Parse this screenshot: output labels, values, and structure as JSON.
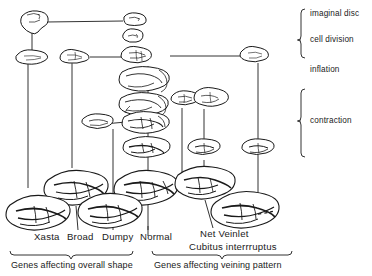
{
  "figure": {
    "type": "developmental-pathway-diagram",
    "stroke_color": "#1a1a1a",
    "background_color": "#ffffff"
  },
  "stage_labels": [
    {
      "id": "imaginal-disc",
      "text": "imaginal disc",
      "x": 310,
      "y": 14
    },
    {
      "id": "cell-division",
      "text": "cell division",
      "x": 310,
      "y": 40
    },
    {
      "id": "inflation",
      "text": "inflation",
      "x": 310,
      "y": 70
    },
    {
      "id": "contraction",
      "text": "contraction",
      "x": 310,
      "y": 121
    }
  ],
  "brackets": [
    {
      "id": "cell-division-bracket",
      "x": 300,
      "y": 8,
      "height": 50,
      "tick_y": 40
    },
    {
      "id": "contraction-bracket",
      "x": 300,
      "y": 88,
      "height": 70,
      "tick_y": 121
    }
  ],
  "genotype_labels": [
    {
      "id": "xasta",
      "text": "Xasta",
      "x": 36,
      "y": 238
    },
    {
      "id": "broad",
      "text": "Broad",
      "x": 68,
      "y": 238
    },
    {
      "id": "dumpy",
      "text": "Dumpy",
      "x": 103,
      "y": 238
    },
    {
      "id": "normal",
      "text": "Normal",
      "x": 142,
      "y": 238
    },
    {
      "id": "net-veinlet",
      "text": "Net Veinlet",
      "x": 201,
      "y": 235
    },
    {
      "id": "cubitus-interruptus",
      "text": "Cubitus interrruptus",
      "x": 190,
      "y": 248
    }
  ],
  "group_labels": [
    {
      "id": "overall-shape-group",
      "text": "Genes affecting overall shape",
      "x": 12,
      "y": 266,
      "bracket": {
        "x1": 10,
        "x2": 133,
        "y": 256,
        "tick_x": 71
      }
    },
    {
      "id": "veining-pattern-group",
      "text": "Genes affecting veining pattern",
      "x": 155,
      "y": 266,
      "bracket": {
        "x1": 152,
        "x2": 292,
        "y": 256,
        "tick_x": 222
      }
    }
  ],
  "stages": {
    "row_imaginal_disc_y": 20,
    "row_cell_division_y": 40,
    "row_inflation_y": 60,
    "row_contraction_y": 120,
    "row_adult_y": 200
  },
  "columns": [
    {
      "id": "col-xasta",
      "x": 28
    },
    {
      "id": "col-broad",
      "x": 66
    },
    {
      "id": "col-dumpy",
      "x": 110
    },
    {
      "id": "col-normal",
      "x": 148
    },
    {
      "id": "col-net-veinlet",
      "x": 204
    },
    {
      "id": "col-cubitus",
      "x": 258
    }
  ],
  "legend_note": "Wing outlines trace development from imaginal disc through cell division, inflation and contraction to the adult wing for normal and mutant genotypes."
}
